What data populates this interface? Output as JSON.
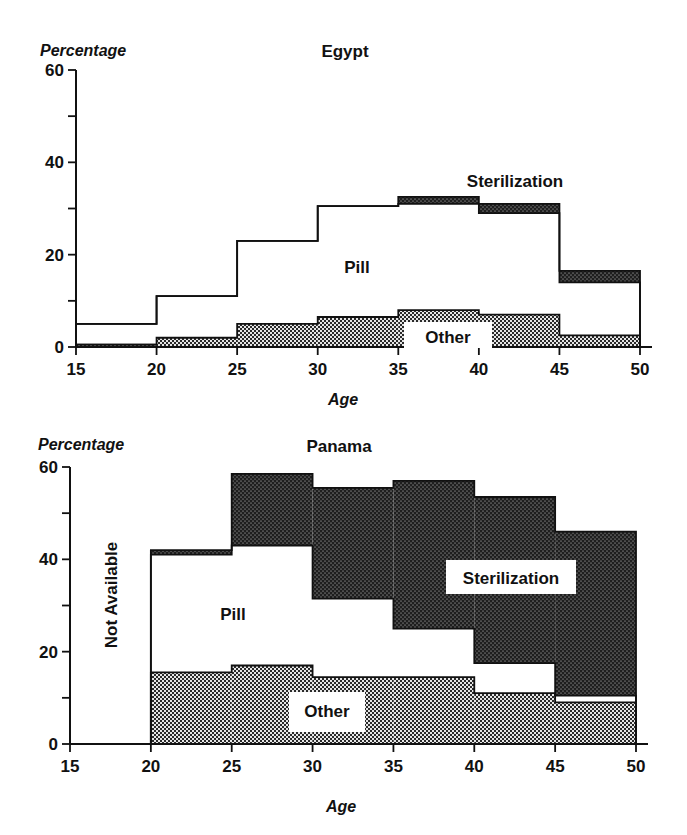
{
  "colors": {
    "ink": "#111111",
    "background": "#ffffff",
    "sterilization_fill": "#1e1e1e",
    "other_fill": "#8a8a8a",
    "pill_fill": "#ffffff"
  },
  "chart_data": [
    {
      "type": "area",
      "subtype": "stacked-step",
      "title": "Egypt",
      "xlabel": "Age",
      "ylabel": "Percentage",
      "xlim": [
        15,
        50
      ],
      "ylim": [
        0,
        60
      ],
      "x_ticks": [
        15,
        20,
        25,
        30,
        35,
        40,
        45,
        50
      ],
      "y_ticks_labeled": [
        0,
        20,
        40,
        60
      ],
      "y_ticks_minor": [
        10,
        30,
        50
      ],
      "grid": false,
      "legend": "inline labels",
      "categories": [
        "15-20",
        "20-25",
        "25-30",
        "30-35",
        "35-40",
        "40-45",
        "45-50"
      ],
      "series": [
        {
          "name": "Other",
          "values": [
            0.5,
            2,
            5,
            6.5,
            8,
            7,
            2.5
          ]
        },
        {
          "name": "Pill",
          "values": [
            4.5,
            9,
            18,
            24,
            23,
            22,
            11.5
          ]
        },
        {
          "name": "Sterilization",
          "values": [
            0,
            0,
            0,
            0,
            1.5,
            2,
            2.5
          ]
        }
      ],
      "totals": [
        5,
        11,
        23,
        30.5,
        32.5,
        31,
        16.5
      ],
      "annotations": [
        {
          "text": "Sterilization",
          "x": 40,
          "y": 36
        },
        {
          "text": "Pill",
          "x": 33.5,
          "y": 17
        },
        {
          "text": "Other",
          "x": 37.5,
          "y": 2.5
        }
      ]
    },
    {
      "type": "area",
      "subtype": "stacked-step",
      "title": "Panama",
      "xlabel": "Age",
      "ylabel": "Percentage",
      "xlim": [
        15,
        50
      ],
      "ylim": [
        0,
        60
      ],
      "x_ticks": [
        15,
        20,
        25,
        30,
        35,
        40,
        45,
        50
      ],
      "y_ticks_labeled": [
        0,
        20,
        40,
        60
      ],
      "y_ticks_minor": [
        10,
        30,
        50
      ],
      "grid": false,
      "legend": "inline labels",
      "categories": [
        "15-20",
        "20-25",
        "25-30",
        "30-35",
        "35-40",
        "40-45",
        "45-50"
      ],
      "series": [
        {
          "name": "Other",
          "values": [
            null,
            15.5,
            17,
            14.5,
            14.5,
            11,
            9
          ]
        },
        {
          "name": "Pill",
          "values": [
            null,
            25.5,
            26,
            17,
            10.5,
            6.5,
            1.5
          ]
        },
        {
          "name": "Sterilization",
          "values": [
            null,
            1,
            15.5,
            24,
            32,
            36,
            35.5
          ]
        }
      ],
      "totals": [
        null,
        42,
        58.5,
        55.5,
        57,
        53.5,
        46
      ],
      "annotations": [
        {
          "text": "Not Available",
          "x": 17.5,
          "y": 30,
          "rotated": true
        },
        {
          "text": "Sterilization",
          "x": 42,
          "y": 36
        },
        {
          "text": "Pill",
          "x": 28,
          "y": 28
        },
        {
          "text": "Other",
          "x": 34.5,
          "y": 7
        }
      ]
    }
  ],
  "egypt": {
    "title": "Egypt",
    "ylabel": "Percentage",
    "xlabel": "Age",
    "labels": {
      "sterilization": "Sterilization",
      "pill": "Pill",
      "other": "Other"
    }
  },
  "panama": {
    "title": "Panama",
    "ylabel": "Percentage",
    "xlabel": "Age",
    "labels": {
      "sterilization": "Sterilization",
      "pill": "Pill",
      "other": "Other",
      "not_available": "Not Available"
    }
  }
}
